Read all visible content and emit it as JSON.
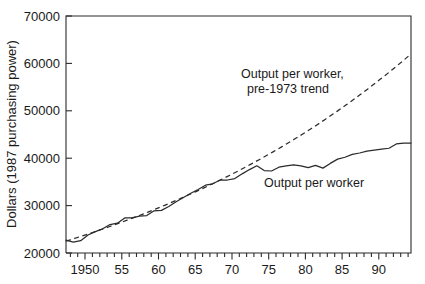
{
  "chart_data": {
    "type": "line",
    "title": "",
    "xlabel": "",
    "ylabel": "Dollars (1987 purchasing power)",
    "xlim": [
      1947,
      1994
    ],
    "ylim": [
      20000,
      70000
    ],
    "grid": false,
    "legend_position": "inline-annotations",
    "ytick_labels": [
      "20000",
      "30000",
      "40000",
      "50000",
      "60000",
      "70000"
    ],
    "ytick_values": [
      20000,
      30000,
      40000,
      50000,
      60000,
      70000
    ],
    "xtick_labels": [
      "1950",
      "55",
      "60",
      "65",
      "70",
      "75",
      "80",
      "85",
      "90"
    ],
    "xtick_values": [
      1950,
      1955,
      1960,
      1965,
      1970,
      1975,
      1980,
      1985,
      1990
    ],
    "xtick_minor_step": 1,
    "annotations": [
      {
        "id": "trend-label",
        "text_line1": "Output per worker,",
        "text_line2": "pre-1973 trend",
        "x": 1975,
        "y": 52500
      },
      {
        "id": "actual-label",
        "text": "Output per worker",
        "x": 1978,
        "y": 34200
      }
    ],
    "series": [
      {
        "name": "Output per worker",
        "style": "solid",
        "color": "#2b2b2b",
        "x": [
          1947,
          1948,
          1949,
          1950,
          1951,
          1952,
          1953,
          1954,
          1955,
          1956,
          1957,
          1958,
          1959,
          1960,
          1961,
          1962,
          1963,
          1964,
          1965,
          1966,
          1967,
          1968,
          1969,
          1970,
          1971,
          1972,
          1973,
          1974,
          1975,
          1976,
          1977,
          1978,
          1979,
          1980,
          1981,
          1982,
          1983,
          1984,
          1985,
          1986,
          1987,
          1988,
          1989,
          1990,
          1991,
          1992,
          1993,
          1994
        ],
        "values": [
          22700,
          22300,
          22600,
          23800,
          24500,
          25100,
          26000,
          26300,
          27400,
          27400,
          27800,
          27900,
          28900,
          29000,
          29800,
          30800,
          31700,
          32600,
          33400,
          34300,
          34600,
          35400,
          35400,
          35700,
          36700,
          37600,
          38400,
          37400,
          37300,
          38100,
          38400,
          38600,
          38400,
          38000,
          38500,
          37900,
          38900,
          39800,
          40200,
          40800,
          41100,
          41500,
          41700,
          41900,
          42100,
          43000,
          43200,
          43200
        ]
      },
      {
        "name": "Output per worker, pre-1973 trend",
        "style": "dashed",
        "color": "#2b2b2b",
        "x": [
          1947,
          1994
        ],
        "values": [
          22500,
          62000
        ],
        "note": "exponential extrapolation of pre-1973 growth"
      }
    ]
  },
  "axis": {
    "y_label": "Dollars (1987 purchasing power)"
  }
}
